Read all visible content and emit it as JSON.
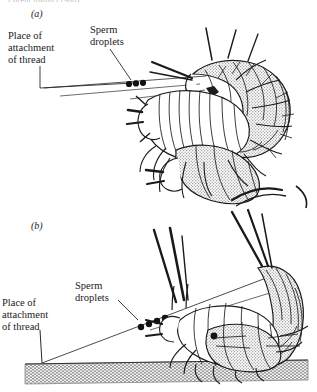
{
  "figure": {
    "title_fragment": "Lorem ipsum (1968)",
    "background_color": "#ffffff",
    "ink_color": "#1a1a1a",
    "shade_color": "#c9c9c9",
    "ground_color": "#bdbdbd"
  },
  "panels": [
    {
      "id": "a",
      "label": "(a)",
      "description": "Pair of springtails (Collembola) facing each other with sperm droplets on a thread",
      "labels": [
        {
          "name": "place-of-attachment",
          "lines": [
            "Place of",
            "attachment",
            "of thread"
          ]
        },
        {
          "name": "sperm-droplets",
          "lines": [
            "Sperm",
            "droplets"
          ]
        }
      ],
      "droplet_count": 3
    },
    {
      "id": "b",
      "label": "(b)",
      "description": "Springtail pair on substrate, thread attached to ground with sperm droplets",
      "labels": [
        {
          "name": "place-of-attachment",
          "lines": [
            "Place of",
            "attachment",
            "of thread"
          ]
        },
        {
          "name": "sperm-droplets",
          "lines": [
            "Sperm",
            "droplets"
          ]
        }
      ],
      "droplet_count": 4,
      "ground": {
        "name": "substrate-band",
        "style": "stippled-hatch"
      }
    }
  ]
}
